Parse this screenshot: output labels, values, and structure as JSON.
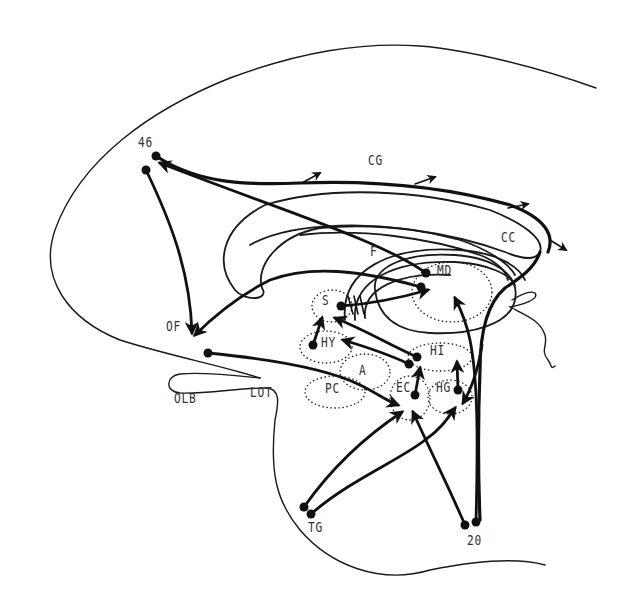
{
  "diagram": {
    "title": "",
    "colors": {
      "ink": "#111111",
      "background": "#ffffff",
      "label": "#333333"
    },
    "labels": [
      {
        "id": "46",
        "text": "46",
        "x": 138,
        "y": 142
      },
      {
        "id": "CG",
        "text": "CG",
        "x": 368,
        "y": 160
      },
      {
        "id": "CC",
        "text": "CC",
        "x": 501,
        "y": 237
      },
      {
        "id": "F",
        "text": "F",
        "x": 370,
        "y": 251
      },
      {
        "id": "MD",
        "text": "MD",
        "x": 437,
        "y": 270
      },
      {
        "id": "S",
        "text": "S",
        "x": 322,
        "y": 300
      },
      {
        "id": "OF",
        "text": "OF",
        "x": 166,
        "y": 326
      },
      {
        "id": "HY",
        "text": "HY",
        "x": 321,
        "y": 342
      },
      {
        "id": "HI",
        "text": "HI",
        "x": 430,
        "y": 350
      },
      {
        "id": "A",
        "text": "A",
        "x": 359,
        "y": 370
      },
      {
        "id": "PC",
        "text": "PC",
        "x": 325,
        "y": 388
      },
      {
        "id": "EC",
        "text": "EC",
        "x": 396,
        "y": 387
      },
      {
        "id": "HG",
        "text": "HG",
        "x": 436,
        "y": 387
      },
      {
        "id": "OLB",
        "text": "OLB",
        "x": 174,
        "y": 398
      },
      {
        "id": "LOT",
        "text": "LOT",
        "x": 250,
        "y": 392
      },
      {
        "id": "TG",
        "text": "TG",
        "x": 308,
        "y": 527
      },
      {
        "id": "20",
        "text": "20",
        "x": 467,
        "y": 540
      }
    ],
    "nodes": [
      {
        "id": "46a",
        "x": 156,
        "y": 156
      },
      {
        "id": "46b",
        "x": 146,
        "y": 170
      },
      {
        "id": "MD1",
        "x": 426,
        "y": 273
      },
      {
        "id": "MD2",
        "x": 421,
        "y": 287
      },
      {
        "id": "S1",
        "x": 341,
        "y": 306
      },
      {
        "id": "OFsrc",
        "x": 208,
        "y": 353
      },
      {
        "id": "HY1",
        "x": 313,
        "y": 345
      },
      {
        "id": "HI1",
        "x": 417,
        "y": 357
      },
      {
        "id": "HI2",
        "x": 409,
        "y": 364
      },
      {
        "id": "EC1",
        "x": 415,
        "y": 395
      },
      {
        "id": "HG1",
        "x": 458,
        "y": 390
      },
      {
        "id": "TG1",
        "x": 304,
        "y": 507
      },
      {
        "id": "TG2",
        "x": 311,
        "y": 514
      },
      {
        "id": "20a",
        "x": 465,
        "y": 525
      },
      {
        "id": "20b",
        "x": 476,
        "y": 522
      }
    ],
    "connections": [
      {
        "from": "46",
        "to": "CG",
        "label": "cingulum fibres (46 → CG)"
      },
      {
        "from": "MD",
        "to": "46",
        "label": "MD → 46"
      },
      {
        "from": "46",
        "to": "OF",
        "label": "46 → OF"
      },
      {
        "from": "MD",
        "to": "OF",
        "label": "MD → OF"
      },
      {
        "from": "S",
        "to": "MD",
        "label": "S → MD"
      },
      {
        "from": "HY",
        "to": "S",
        "label": "HY → S"
      },
      {
        "from": "HI",
        "to": "S",
        "label": "HI → S"
      },
      {
        "from": "HI",
        "to": "HY",
        "label": "HI → HY"
      },
      {
        "from": "OF",
        "to": "EC",
        "label": "OF → EC"
      },
      {
        "from": "EC",
        "to": "HI",
        "label": "EC → HI"
      },
      {
        "from": "HG",
        "to": "HI",
        "label": "HG → HI"
      },
      {
        "from": "TG",
        "to": "EC",
        "label": "TG → EC"
      },
      {
        "from": "TG",
        "to": "HG",
        "label": "TG → HG"
      },
      {
        "from": "20",
        "to": "EC",
        "label": "20 → EC"
      },
      {
        "from": "20",
        "to": "MD",
        "label": "20 → MD"
      },
      {
        "from": "CC",
        "to": "HG",
        "label": "fornix/CG → HG"
      }
    ]
  }
}
